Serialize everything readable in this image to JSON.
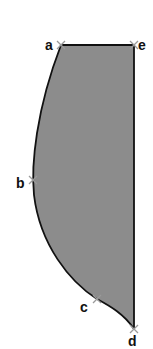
{
  "diagram": {
    "type": "shaded-region",
    "fill_color": "#8c8c8c",
    "stroke_color": "#111111",
    "marker_color": "#9a9a9a",
    "points": [
      {
        "id": "a",
        "label": "a",
        "x": 61,
        "y": 45
      },
      {
        "id": "b",
        "label": "b",
        "x": 33,
        "y": 180
      },
      {
        "id": "c",
        "label": "c",
        "x": 97,
        "y": 299
      },
      {
        "id": "d",
        "label": "d",
        "x": 134,
        "y": 329
      },
      {
        "id": "e",
        "label": "e",
        "x": 134,
        "y": 45
      }
    ],
    "edges": [
      {
        "from": "a",
        "to": "e",
        "kind": "straight"
      },
      {
        "from": "e",
        "to": "d",
        "kind": "straight"
      },
      {
        "from": "d",
        "to": "c",
        "kind": "curve"
      },
      {
        "from": "c",
        "to": "b",
        "kind": "curve"
      },
      {
        "from": "b",
        "to": "a",
        "kind": "curve"
      }
    ]
  }
}
